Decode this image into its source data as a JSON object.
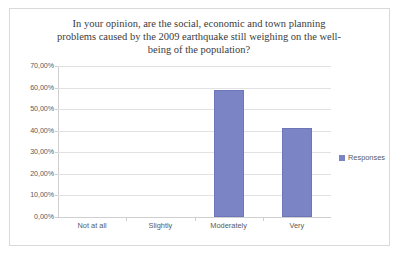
{
  "chart_data": {
    "type": "bar",
    "title_lines": [
      "In your opinion, are the social, economic and town planning",
      "problems caused by the 2009 earthquake still weighing on the well-",
      "being of the population?"
    ],
    "categories": [
      "Not at all",
      "Slightly",
      "Moderately",
      "Very"
    ],
    "values": [
      0,
      0,
      58.8,
      41.2
    ],
    "value_labels": [
      "0,00%",
      "0,00%",
      "58,80%",
      "41,20%"
    ],
    "series": [
      {
        "name": "Responses",
        "values": [
          0,
          0,
          58.8,
          41.2
        ],
        "color": "#7b84c4"
      }
    ],
    "xlabel": "",
    "ylabel": "",
    "ylim": [
      0,
      70
    ],
    "ytick_values": [
      0,
      10,
      20,
      30,
      40,
      50,
      60,
      70
    ],
    "ytick_labels": [
      "0,00%",
      "10,00%",
      "20,00%",
      "30,00%",
      "40,00%",
      "50,00%",
      "60,00%",
      "70,00%"
    ],
    "grid": true,
    "legend": {
      "position": "right",
      "entries": [
        "Responses"
      ]
    },
    "colors": {
      "bar": "#7b84c4",
      "bar_border": "#6d76b8",
      "gridline": "#e2e2e2",
      "axis": "#cfcfcf",
      "frame_border": "#d9d9d9",
      "text": "#5a5a5a",
      "title_text": "#3b3b3b",
      "background": "#ffffff"
    }
  }
}
